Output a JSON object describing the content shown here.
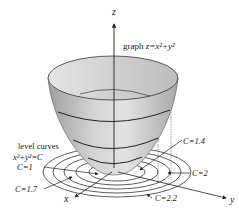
{
  "axes": {
    "z_label": "z",
    "x_label": "x",
    "y_label": "y"
  },
  "graph_label": {
    "prefix": "graph ",
    "equation": "z=x²+y²"
  },
  "level_curves_label": {
    "title": "level curves",
    "equation": "x²+y²=C"
  },
  "level_values": [
    {
      "label": "C=1"
    },
    {
      "label": "C=1.4"
    },
    {
      "label": "C=1.7"
    },
    {
      "label": "C=2"
    },
    {
      "label": "C=2.2"
    }
  ],
  "colors": {
    "surface": "#c8c8c8",
    "surface_dark": "#a9a9a9",
    "lines": "#222222"
  }
}
